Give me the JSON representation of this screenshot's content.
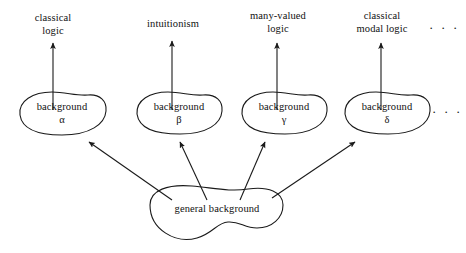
{
  "diagram": {
    "stroke_color": "#1a1a1a",
    "text_color": "#111111",
    "background_color": "#ffffff",
    "ellipsis": "· · ·",
    "general": {
      "label": "general background"
    },
    "branches": [
      {
        "top_label": "classical\nlogic",
        "blob_label": "background\nα",
        "greek": "α"
      },
      {
        "top_label": "intuitionism",
        "blob_label": "background\nβ",
        "greek": "β"
      },
      {
        "top_label": "many-valued\nlogic",
        "blob_label": "background\nγ",
        "greek": "γ"
      },
      {
        "top_label": "classical\nmodal logic",
        "blob_label": "background\nδ",
        "greek": "δ"
      }
    ]
  }
}
